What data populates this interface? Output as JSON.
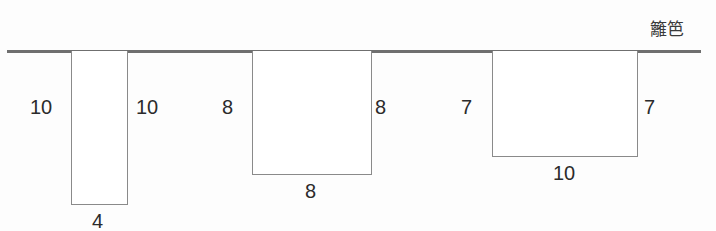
{
  "figure": {
    "title": "",
    "background_color": "#fdfdfd",
    "line_color": "#6f6f6f",
    "rect_stroke_color": "#8a8a8a",
    "text_color": "#2b2b2b",
    "fence": {
      "caption": "籬笆",
      "caption_x": 650,
      "caption_y": 21,
      "line_x": 7,
      "line_y": 50,
      "line_width": 694,
      "line_height": 3
    },
    "pens": [
      {
        "id": "pen-1",
        "x": 71,
        "y": 51,
        "width": 57,
        "height": 154,
        "left_label": "10",
        "left_label_x": 30,
        "left_label_y": 97,
        "right_label": "10",
        "right_label_x": 136,
        "right_label_y": 97,
        "bottom_label": "4",
        "bottom_label_x": 92,
        "bottom_label_y": 211
      },
      {
        "id": "pen-2",
        "x": 252,
        "y": 51,
        "width": 120,
        "height": 124,
        "left_label": "8",
        "left_label_x": 222,
        "left_label_y": 97,
        "right_label": "8",
        "right_label_x": 375,
        "right_label_y": 97,
        "bottom_label": "8",
        "bottom_label_x": 305,
        "bottom_label_y": 181
      },
      {
        "id": "pen-3",
        "x": 492,
        "y": 51,
        "width": 146,
        "height": 106,
        "left_label": "7",
        "left_label_x": 461,
        "left_label_y": 97,
        "right_label": "7",
        "right_label_x": 644,
        "right_label_y": 97,
        "bottom_label": "10",
        "bottom_label_x": 553,
        "bottom_label_y": 163
      }
    ]
  },
  "chart_data": {
    "type": "diagram",
    "annotations": [
      "籬笆"
    ],
    "shapes": [
      {
        "name": "pen-1",
        "shape": "rectangle",
        "width": 4,
        "height": 10,
        "labels": {
          "left": "10",
          "right": "10",
          "bottom": "4"
        }
      },
      {
        "name": "pen-2",
        "shape": "rectangle",
        "width": 8,
        "height": 8,
        "labels": {
          "left": "8",
          "right": "8",
          "bottom": "8"
        }
      },
      {
        "name": "pen-3",
        "shape": "rectangle",
        "width": 10,
        "height": 7,
        "labels": {
          "left": "7",
          "right": "7",
          "bottom": "10"
        }
      }
    ],
    "xlabel": "",
    "ylabel": ""
  }
}
